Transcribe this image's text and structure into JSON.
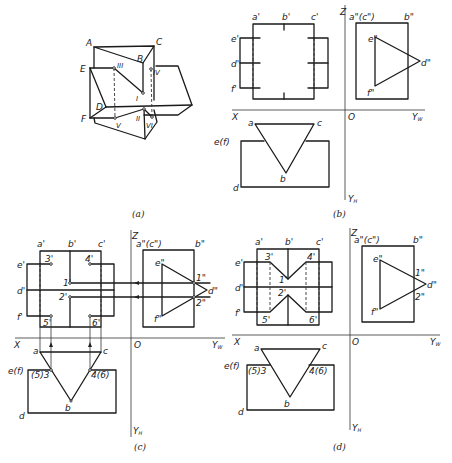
{
  "figure": {
    "panels": [
      {
        "id": "a",
        "caption": "(a)",
        "type": "axonometric",
        "vertex_labels": [
          "A",
          "B",
          "C",
          "D",
          "E",
          "F"
        ],
        "point_labels": [
          "I",
          "II",
          "III",
          "IV",
          "V",
          "VI"
        ]
      },
      {
        "id": "b",
        "caption": "(b)",
        "type": "three-view",
        "front_labels": [
          "a'",
          "b'",
          "c'",
          "e'",
          "d'",
          "f'"
        ],
        "side_labels": [
          "a\"(c\")",
          "b\"",
          "e\"",
          "d\"",
          "f\""
        ],
        "top_labels": [
          "a",
          "c",
          "b",
          "e(f)",
          "d"
        ],
        "axes": {
          "x": "X",
          "z": "Z",
          "origin": "O",
          "yw": "Yw",
          "yh": "YH"
        }
      },
      {
        "id": "c",
        "caption": "(c)",
        "type": "three-view-construction",
        "front_labels": [
          "a'",
          "b'",
          "c'",
          "e'",
          "d'",
          "f'",
          "3'",
          "4'",
          "1'",
          "2'",
          "5'",
          "6'"
        ],
        "side_labels": [
          "a\"(c\")",
          "b\"",
          "e\"",
          "d\"",
          "f\"",
          "1\"",
          "2\""
        ],
        "top_labels": [
          "a",
          "c",
          "b",
          "e(f)",
          "(5)3",
          "4(6)",
          "d"
        ],
        "axes": {
          "x": "X",
          "z": "Z",
          "origin": "O",
          "yw": "Yw",
          "yh": "YH"
        }
      },
      {
        "id": "d",
        "caption": "(d)",
        "type": "three-view-result",
        "front_labels": [
          "a'",
          "b'",
          "c'",
          "e'",
          "d'",
          "f'",
          "3'",
          "4'",
          "1'",
          "2'",
          "5'",
          "6'"
        ],
        "side_labels": [
          "a\"(c\")",
          "b\"",
          "e\"",
          "d\"",
          "f\"",
          "1\"",
          "2\""
        ],
        "top_labels": [
          "a",
          "c",
          "b",
          "e(f)",
          "(5)3",
          "4(6)",
          "d"
        ],
        "axes": {
          "x": "X",
          "z": "Z",
          "origin": "O",
          "yw": "Yw",
          "yh": "YH"
        }
      }
    ]
  },
  "labels": {
    "a": {
      "A": "A",
      "B": "B",
      "C": "C",
      "D": "D",
      "E": "E",
      "F": "F",
      "I": "I",
      "II": "II",
      "III": "III",
      "IV": "IV",
      "V": "V",
      "VI": "VI",
      "cap": "(a)"
    },
    "b": {
      "ap": "a'",
      "bp": "b'",
      "cp": "c'",
      "ep": "e'",
      "dp": "d'",
      "fp": "f'",
      "acpp": "a\"(c\")",
      "bpp": "b\"",
      "epp": "e\"",
      "dpp": "d\"",
      "fpp": "f\"",
      "a": "a",
      "c": "c",
      "b": "b",
      "ef": "e(f)",
      "d": "d",
      "X": "X",
      "Z": "Z",
      "O": "O",
      "YW": "Y",
      "YWs": "W",
      "YH": "Y",
      "YHs": "H",
      "cap": "(b)"
    },
    "c": {
      "ap": "a'",
      "bp": "b'",
      "cp": "c'",
      "ep": "e'",
      "dp": "d'",
      "fp": "f'",
      "p3": "3'",
      "p4": "4'",
      "p1": "1'",
      "p2": "2'",
      "p5": "5'",
      "p6": "6'",
      "acpp": "a\"(c\")",
      "bpp": "b\"",
      "epp": "e\"",
      "dpp": "d\"",
      "fpp": "f\"",
      "p1pp": "1\"",
      "p2pp": "2\"",
      "a": "a",
      "c": "c",
      "b": "b",
      "ef": "e(f)",
      "s53": "(5)3",
      "s46": "4(6)",
      "d": "d",
      "X": "X",
      "Z": "Z",
      "O": "O",
      "YW": "Y",
      "YWs": "W",
      "YH": "Y",
      "YHs": "H",
      "cap": "(c)"
    },
    "d": {
      "ap": "a'",
      "bp": "b'",
      "cp": "c'",
      "ep": "e'",
      "dp": "d'",
      "fp": "f'",
      "p3": "3'",
      "p4": "4'",
      "p1": "1'",
      "p2": "2'",
      "p5": "5'",
      "p6": "6'",
      "acpp": "a\"(c\")",
      "bpp": "b\"",
      "epp": "e\"",
      "dpp": "d\"",
      "fpp": "f\"",
      "p1pp": "1\"",
      "p2pp": "2\"",
      "a": "a",
      "c": "c",
      "b": "b",
      "ef": "e(f)",
      "s53": "(5)3",
      "s46": "4(6)",
      "d": "d",
      "X": "X",
      "Z": "Z",
      "O": "O",
      "YW": "Y",
      "YWs": "W",
      "YH": "Y",
      "YHs": "H",
      "cap": "(d)"
    }
  }
}
